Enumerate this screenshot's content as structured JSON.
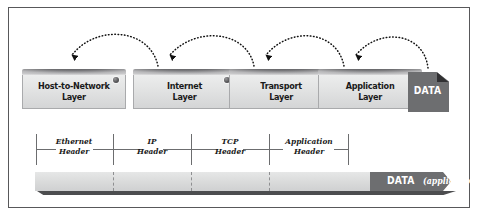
{
  "figure": {
    "frame_color": "#58585a",
    "background": "#ffffff"
  },
  "layers": [
    {
      "id": "host-to-network",
      "label": "Host-to-Network\nLayer",
      "left": 22
    },
    {
      "id": "internet",
      "label": "Internet\nLayer",
      "left": 133
    },
    {
      "id": "transport",
      "label": "Transport\nLayer",
      "left": 229
    },
    {
      "id": "application",
      "label": "Application\nLayer",
      "left": 318
    }
  ],
  "data_icon": {
    "label": "DATA",
    "icon": "document-icon",
    "fill": "#6d6e70",
    "fold_fill": "#303032",
    "text_color": "#ffffff"
  },
  "arrows": {
    "style": "dotted-arc",
    "count": 4,
    "direction": "right-to-left",
    "color": "#1a1a1a",
    "description": "Each dotted arc points down into the next layer box to the left"
  },
  "headers": [
    {
      "id": "ethernet-header",
      "label": "Ethernet\nHeader",
      "center": 74,
      "start": 36,
      "end": 113
    },
    {
      "id": "ip-header",
      "label": "IP\nHeader",
      "center": 152,
      "start": 113,
      "end": 191
    },
    {
      "id": "tcp-header",
      "label": "TCP\nHeader",
      "center": 230,
      "start": 191,
      "end": 269
    },
    {
      "id": "application-header",
      "label": "Application\nHeader",
      "center": 308,
      "start": 269,
      "end": 348
    }
  ],
  "bar": {
    "light_fill": "#d9dada",
    "dark_fill": "#6d6e70",
    "shadow_fill": "#4c4d4f",
    "data_label": "DATA",
    "application_label": "(application)",
    "dividers": [
      78,
      156,
      234
    ],
    "dark_start": 335
  }
}
